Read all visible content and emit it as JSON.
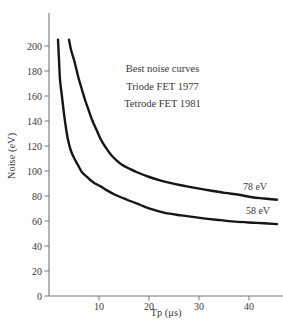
{
  "figure": {
    "background": "#fefefe",
    "text_color": "#3a3a3a",
    "axis_color": "#777777",
    "curve_color": "#161616"
  },
  "chart_data": {
    "type": "line",
    "title": "",
    "xlabel": "Tp (μs)",
    "ylabel": "Noise (eV)",
    "xlim": [
      0,
      46.8
    ],
    "ylim": [
      0,
      226.4
    ],
    "x_ticks": [
      10,
      20,
      30,
      40
    ],
    "y_ticks": [
      0,
      20,
      40,
      60,
      80,
      100,
      120,
      140,
      160,
      180,
      200
    ],
    "grid": false,
    "legend": "none",
    "annotation": {
      "lines": [
        "Best noise curves",
        "Triode FET 1977",
        "Tetrode FET 1981"
      ]
    },
    "series": [
      {
        "name": "Triode FET 1977",
        "asymptote_ev": 78,
        "x": [
          4.0,
          4.4,
          5.0,
          5.5,
          6.0,
          6.6,
          7.2,
          7.9,
          8.6,
          9.5,
          10.4,
          11.4,
          12.4,
          13.5,
          14.6,
          16.0,
          17.6,
          20.2,
          22.2,
          24.2,
          26.7,
          29.2,
          32.2,
          35.2,
          38.0,
          40.6,
          43.0,
          45.6
        ],
        "y": [
          205,
          197,
          189,
          181,
          173,
          165,
          157,
          149,
          141,
          133,
          125,
          118.5,
          113,
          108.5,
          105,
          102,
          99,
          95,
          92.5,
          90.5,
          88.4,
          86.5,
          84.4,
          82.5,
          81,
          79,
          78,
          77
        ]
      },
      {
        "name": "Tetrode FET 1981",
        "asymptote_ev": 58,
        "x": [
          1.8,
          2.0,
          2.2,
          2.55,
          2.9,
          3.3,
          3.8,
          4.4,
          5.2,
          5.9,
          6.6,
          7.4,
          8.2,
          9.2,
          10.2,
          11.6,
          13.2,
          15.6,
          18.2,
          20.5,
          23.2,
          26.5,
          30.2,
          33.5,
          37.2,
          41.5,
          45.6
        ],
        "y": [
          205,
          189,
          173,
          161,
          149,
          137,
          125,
          116,
          109,
          104,
          99,
          96,
          93,
          90,
          88,
          84.5,
          81,
          77,
          73,
          69.5,
          66.5,
          64.5,
          62.5,
          61,
          59.5,
          58.5,
          57.5
        ]
      }
    ],
    "curve_labels": [
      {
        "text": "78 eV"
      },
      {
        "text": "58 eV"
      }
    ]
  }
}
